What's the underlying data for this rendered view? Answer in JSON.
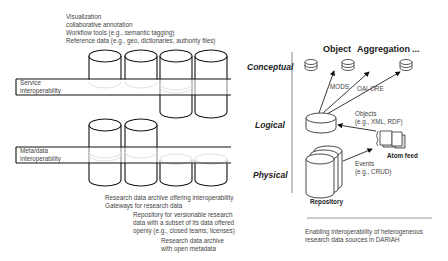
{
  "left_panel": {
    "top_labels": [
      "Visualization",
      "collaborative annotation",
      "Workflow tools (e.g., semantic tagging)",
      "Reference data (e.g., geo, dictionaries, authority files)"
    ],
    "bands": [
      {
        "line1": "Service",
        "line2": "interoperability"
      },
      {
        "line1": "Meta/data",
        "line2": "interoperability"
      }
    ],
    "bottom_labels": [
      "Research data archive offering interoperability",
      "Gateways for research data",
      "Repository for versionable research",
      "data with a subset of its data offered",
      "openly (e.g., closed teams, licenses)",
      "Research data archive",
      "with open metadata"
    ]
  },
  "levels": {
    "conceptual": "Conceptual",
    "logical": "Logical",
    "physical": "Physical"
  },
  "right_panel": {
    "headers": [
      "Object",
      "Aggregation",
      "..."
    ],
    "arrow_labels": {
      "mods": "MODS",
      "oai_ore": "OAI-ORE"
    },
    "objects_label": [
      "Objects",
      "(e.g., XML, RDF)"
    ],
    "events_label": [
      "Events",
      "(e.g., CRUD)"
    ],
    "atom_feed": "Atom feed",
    "repository": "Repository",
    "caption": [
      "Enabling interoperability of heterogeneous",
      "research data sources in DARIAH"
    ]
  }
}
